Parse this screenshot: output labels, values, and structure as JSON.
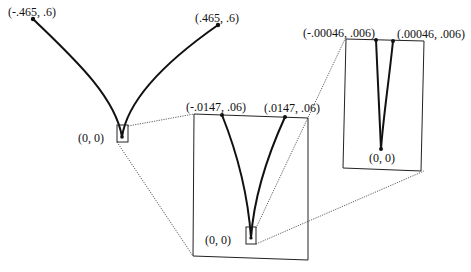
{
  "figure": {
    "type": "zoom-inset cusp diagram",
    "panels": [
      {
        "id": "overview",
        "labels": {
          "left_endpoint": "(-.465, .6)",
          "right_endpoint": "(.465, .6)",
          "origin": "(0, 0)"
        }
      },
      {
        "id": "zoom-1",
        "labels": {
          "left_endpoint": "(-.0147, .06)",
          "right_endpoint": "(.0147, .06)",
          "origin": "(0, 0)"
        }
      },
      {
        "id": "zoom-2",
        "labels": {
          "left_endpoint": "(-.00046, .006)",
          "right_endpoint": "(.00046, .006)",
          "origin": "(0, 0)"
        }
      }
    ],
    "colors": {
      "curve": "#111111",
      "frame": "#222222",
      "connector": "#333333",
      "background": "#ffffff"
    }
  }
}
